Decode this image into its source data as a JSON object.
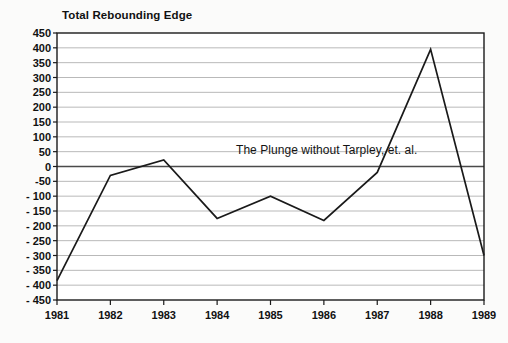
{
  "chart_data": {
    "type": "line",
    "title": "Total Rebounding Edge",
    "xlabel": "",
    "ylabel": "",
    "categories": [
      "1981",
      "1982",
      "1983",
      "1984",
      "1985",
      "1986",
      "1987",
      "1988",
      "1989"
    ],
    "x": [
      1981,
      1982,
      1983,
      1984,
      1985,
      1986,
      1987,
      1988,
      1989
    ],
    "values": [
      -385,
      -30,
      22,
      -175,
      -100,
      -182,
      -20,
      395,
      -300
    ],
    "series": [
      {
        "name": "Total Rebounding Edge",
        "values": [
          -385,
          -30,
          22,
          -175,
          -100,
          -182,
          -20,
          395,
          -300
        ]
      }
    ],
    "ylim": [
      -450,
      450
    ],
    "ytick_values": [
      450,
      400,
      350,
      300,
      250,
      200,
      150,
      100,
      50,
      0,
      -50,
      -100,
      -150,
      -200,
      -250,
      -300,
      -350,
      -400,
      -450
    ],
    "ytick_labels": [
      "450",
      "400",
      "350",
      "300",
      "250",
      "200",
      "150",
      "100",
      "50",
      "0",
      "-50",
      "- 100",
      "- 150",
      "- 200",
      "- 250",
      "- 300",
      "- 350",
      "- 400",
      "- 450"
    ],
    "xtick_labels": [
      "1981",
      "1982",
      "1983",
      "1984",
      "1985",
      "1986",
      "1987",
      "1988",
      "1989"
    ],
    "grid": true,
    "legend": "none",
    "annotations": [
      {
        "text": "The Plunge without Tarpley, et. al.",
        "x": 1985.4,
        "y": 45
      }
    ],
    "colors": {
      "line": "#1a1a1a",
      "grid": "#b9b9b9",
      "axis": "#1a1a1a",
      "zero_line": "#4a4a4a",
      "background": "#ffffff",
      "page_background": "#fbfbfa",
      "text": "#111111"
    }
  }
}
